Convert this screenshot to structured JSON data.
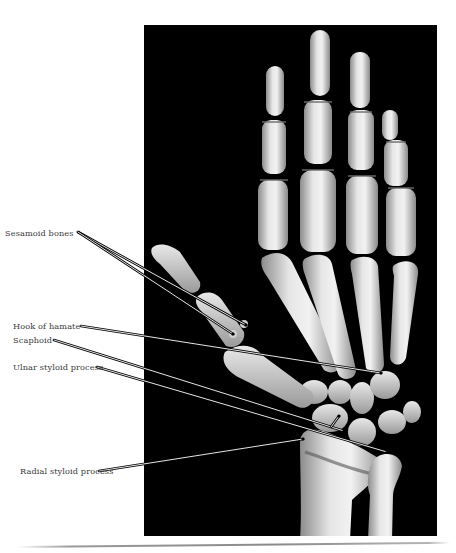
{
  "figure": {
    "type": "3D CT reconstruction of hand and wrist bones (dorsal view)",
    "background_color": "#000000",
    "bone_color": "#d8d8d8",
    "labels": [
      {
        "id": "sesamoid-bones",
        "text": "Sesamoid bones",
        "x": 5,
        "y": 228
      },
      {
        "id": "hook-of-hamate",
        "text": "Hook of hamate",
        "x": 13,
        "y": 322
      },
      {
        "id": "scaphoid",
        "text": "Scaphoid",
        "x": 13,
        "y": 335
      },
      {
        "id": "ulnar-styloid-process",
        "text": "Ulnar styloid process",
        "x": 13,
        "y": 362
      },
      {
        "id": "radial-styloid-process",
        "text": "Radial styloid process",
        "x": 20,
        "y": 467
      }
    ],
    "leaders": [
      {
        "label": "sesamoid-bones",
        "from": [
          78,
          232
        ],
        "to": [
          246,
          325
        ]
      },
      {
        "label": "sesamoid-bones",
        "from": [
          78,
          232
        ],
        "to": [
          233,
          334
        ]
      },
      {
        "label": "hook-of-hamate",
        "from": [
          81,
          326
        ],
        "to": [
          381,
          373
        ]
      },
      {
        "label": "scaphoid",
        "from": [
          54,
          340
        ],
        "to": [
          344,
          431
        ]
      },
      {
        "label": "scaphoid",
        "from": [
          331,
          425
        ],
        "to": [
          339,
          416
        ]
      },
      {
        "label": "ulnar-styloid-process",
        "from": [
          97,
          367
        ],
        "to": [
          387,
          452
        ]
      },
      {
        "label": "radial-styloid-process",
        "from": [
          99,
          471
        ],
        "to": [
          303,
          439
        ]
      }
    ]
  }
}
